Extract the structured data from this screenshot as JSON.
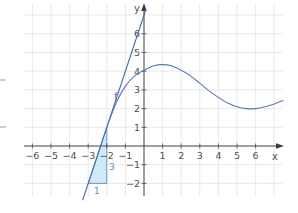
{
  "chart_data": {
    "type": "line",
    "title": "",
    "xlabel": "x",
    "ylabel": "y",
    "xlim": [
      -6.5,
      7.5
    ],
    "ylim": [
      -2.6,
      7.5
    ],
    "grid": true,
    "x_ticks": [
      -6,
      -5,
      -4,
      -3,
      -2,
      -1,
      1,
      2,
      3,
      4,
      5,
      6
    ],
    "y_ticks": [
      -2,
      -1,
      1,
      2,
      3,
      4,
      5,
      6
    ],
    "x_tick_labels": [
      "−6",
      "−5",
      "−4",
      "−3",
      "−2",
      "−1",
      "1",
      "2",
      "3",
      "4",
      "5",
      "6"
    ],
    "y_tick_labels": [
      "−2",
      "−1",
      "1",
      "2",
      "3",
      "4",
      "5",
      "6"
    ],
    "series": [
      {
        "name": "f",
        "kind": "curve",
        "color": "#5b78b5",
        "x": [
          -2,
          -1.5,
          -1,
          -0.5,
          0,
          0.5,
          1,
          1.5,
          2,
          2.5,
          3,
          3.5,
          4,
          4.5,
          5,
          5.5,
          6,
          6.5,
          7,
          7.5
        ],
        "y": [
          1,
          2.3,
          3.2,
          3.75,
          4.05,
          4.28,
          4.35,
          4.28,
          4.05,
          3.75,
          3.35,
          2.95,
          2.6,
          2.3,
          2.1,
          2.0,
          2.0,
          2.1,
          2.25,
          2.45
        ]
      },
      {
        "name": "tangent",
        "kind": "line",
        "color": "#4b6aa8",
        "equation": "y = 3x + 7",
        "x": [
          -3.3,
          0.1
        ],
        "y": [
          -2.9,
          7.3
        ]
      }
    ],
    "annotations": [
      {
        "type": "slope-triangle",
        "vertices": [
          [
            -3,
            -2
          ],
          [
            -2,
            -2
          ],
          [
            -2,
            1
          ]
        ],
        "fill": "#cfe9f8",
        "run_label": "1",
        "rise_label": "3"
      },
      {
        "type": "label",
        "text": "f",
        "x": -1.65,
        "y": 2.55
      }
    ]
  },
  "labels": {
    "x_axis": "x",
    "y_axis": "y",
    "curve_name": "f",
    "run": "1",
    "rise": "3"
  }
}
